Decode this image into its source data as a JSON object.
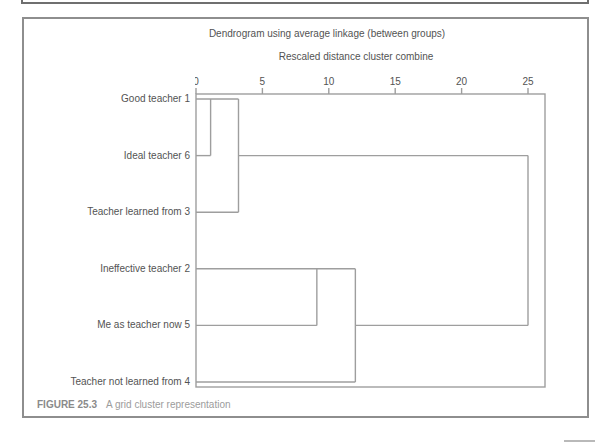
{
  "figure": {
    "title": "Dendrogram using average linkage (between groups)",
    "axis_title": "Rescaled distance cluster combine",
    "caption_label": "FIGURE 25.3",
    "caption_text": "A grid cluster representation"
  },
  "chart_data": {
    "type": "dendrogram",
    "title": "Dendrogram using average linkage (between groups)",
    "axis": {
      "label": "Rescaled distance cluster combine",
      "orientation": "top",
      "ticks": [
        0,
        5,
        10,
        15,
        20,
        25
      ],
      "range": [
        0,
        26.3
      ],
      "grid": false
    },
    "leaves": [
      {
        "label": "Good teacher 1",
        "row": 0
      },
      {
        "label": "Ideal teacher 6",
        "row": 1
      },
      {
        "label": "Teacher learned from 3",
        "row": 2
      },
      {
        "label": "Ineffective teacher 2",
        "row": 3
      },
      {
        "label": "Me as teacher now 5",
        "row": 4
      },
      {
        "label": "Teacher not learned from 4",
        "row": 5
      }
    ],
    "merges": [
      {
        "clusters": [
          "Good teacher 1",
          "Ideal teacher 6"
        ],
        "distance": 1.1
      },
      {
        "clusters": [
          "Good teacher 1 + Ideal teacher 6",
          "Teacher learned from 3"
        ],
        "distance": 3.2
      },
      {
        "clusters": [
          "Ineffective teacher 2",
          "Me as teacher now 5"
        ],
        "distance": 9.1
      },
      {
        "clusters": [
          "Ineffective teacher 2 + Me as teacher now 5",
          "Teacher not learned from 4"
        ],
        "distance": 12.0
      },
      {
        "clusters": [
          "cluster {1,6,3}",
          "cluster {2,5,4}"
        ],
        "distance": 25.0
      }
    ],
    "segments": {
      "horizontal": [
        {
          "row": 0,
          "from": 0,
          "to": 3.2
        },
        {
          "row": 1,
          "from": 0,
          "to": 1.1
        },
        {
          "row": 1,
          "from": 3.2,
          "to": 25.0
        },
        {
          "row": 2,
          "from": 0,
          "to": 3.2
        },
        {
          "row": 3,
          "from": 0,
          "to": 12.0
        },
        {
          "row": 4,
          "from": 0,
          "to": 9.1
        },
        {
          "row": 4,
          "from": 12.0,
          "to": 25.0
        },
        {
          "row": 5,
          "from": 0,
          "to": 12.0
        }
      ],
      "vertical": [
        {
          "distance": 1.1,
          "from_row": 0,
          "to_row": 1
        },
        {
          "distance": 3.2,
          "from_row": 0,
          "to_row": 2
        },
        {
          "distance": 9.1,
          "from_row": 3,
          "to_row": 4
        },
        {
          "distance": 12.0,
          "from_row": 3,
          "to_row": 5
        },
        {
          "distance": 25.0,
          "from_row": 1,
          "to_row": 4
        }
      ]
    },
    "colors": {
      "line": "#9e9e9e",
      "frame": "#9e9e9e",
      "text": "#535353"
    }
  }
}
